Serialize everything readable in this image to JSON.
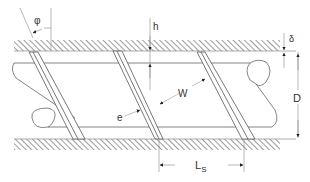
{
  "diagram": {
    "colors": {
      "line": "#555555",
      "hatch": "#666666",
      "dim": "#888888",
      "text": "#333333"
    },
    "labels": {
      "phi": "φ",
      "h": "h",
      "delta": "δ",
      "W": "W",
      "e": "e",
      "D": "D",
      "Ls_main": "L",
      "Ls_sub": "S"
    },
    "components": [
      {
        "name": "barrel-wall-top",
        "description": "hatched barrel wall (top)"
      },
      {
        "name": "barrel-wall-bottom",
        "description": "hatched barrel wall (bottom)"
      },
      {
        "name": "screw-root",
        "description": "screw root cylinder with break ends"
      },
      {
        "name": "flight-1",
        "description": "helical flight, left"
      },
      {
        "name": "flight-2",
        "description": "helical flight, middle"
      },
      {
        "name": "flight-3",
        "description": "helical flight, right"
      }
    ],
    "dimensions": [
      {
        "symbol": "φ",
        "meaning": "helix angle"
      },
      {
        "symbol": "h",
        "meaning": "channel depth"
      },
      {
        "symbol": "δ",
        "meaning": "flight clearance"
      },
      {
        "symbol": "W",
        "meaning": "channel width"
      },
      {
        "symbol": "e",
        "meaning": "flight width"
      },
      {
        "symbol": "D",
        "meaning": "barrel diameter"
      },
      {
        "symbol": "Ls",
        "meaning": "screw lead"
      }
    ]
  }
}
